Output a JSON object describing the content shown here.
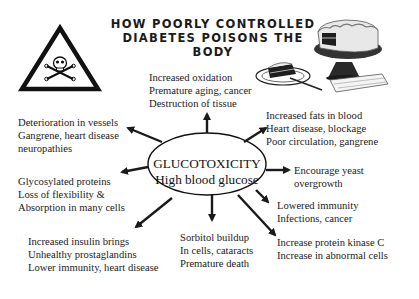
{
  "title": {
    "line1": "HOW POORLY CONTROLLED",
    "line2": "DIABETES POISONS THE BODY"
  },
  "center": {
    "line1": "GLUCOTOXICITY",
    "line2": "High blood glucose"
  },
  "effects": [
    {
      "id": "top",
      "lines": [
        "Increased oxidation",
        "Premature aging, cancer",
        "Destruction of tissue"
      ]
    },
    {
      "id": "upper-left",
      "lines": [
        "Deterioration in vessels",
        "Gangrene, heart disease",
        "neuropathies"
      ]
    },
    {
      "id": "upper-right",
      "lines": [
        "Increased fats in blood",
        "Heart disease, blockage",
        "Poor circulation, gangrene"
      ]
    },
    {
      "id": "left",
      "lines": [
        "Glycosylated proteins",
        "Loss of flexibility &",
        "Absorption in many cells"
      ]
    },
    {
      "id": "right",
      "lines": [
        "Encourage yeast",
        "overgrowth"
      ]
    },
    {
      "id": "lower-right",
      "lines": [
        "Lowered immunity",
        "Infections, cancer"
      ]
    },
    {
      "id": "lower-left",
      "lines": [
        "Increased insulin brings",
        "Unhealthy prostaglandins",
        "Lower immunity, heart disease"
      ]
    },
    {
      "id": "bottom",
      "lines": [
        "Sorbitol buildup",
        "In cells, cataracts",
        "Premature death"
      ]
    },
    {
      "id": "bottom-right",
      "lines": [
        "Increase protein kinase C",
        "Increase in abnormal cells"
      ]
    }
  ],
  "icons": {
    "warning": "skull-crossbones-warning-triangle",
    "illustration": "cake-on-stand-with-slice"
  }
}
